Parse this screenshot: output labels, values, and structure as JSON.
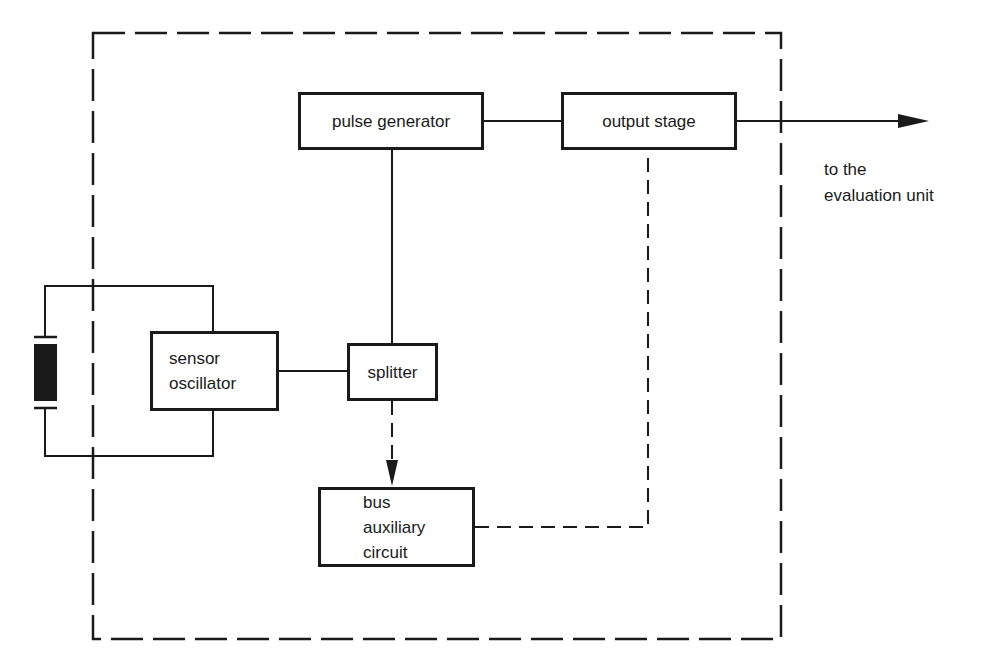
{
  "diagram": {
    "type": "block-diagram",
    "boundary": {
      "style": "dashed",
      "x": 93,
      "y": 33,
      "width": 688,
      "height": 606
    },
    "blocks": {
      "pulse_generator": {
        "label": "pulse generator"
      },
      "output_stage": {
        "label": "output stage"
      },
      "sensor_oscillator": {
        "lines": [
          "sensor",
          "oscillator"
        ]
      },
      "splitter": {
        "label": "splitter"
      },
      "bus_auxiliary_circuit": {
        "lines": [
          "bus",
          "auxiliary",
          "circuit"
        ]
      }
    },
    "crystal": {
      "symbol": "quartz-crystal-icon"
    },
    "output_label": {
      "lines": [
        "to the",
        "evaluation unit"
      ]
    },
    "connections": [
      {
        "from": "sensor crystal",
        "to": "sensor oscillator",
        "style": "solid"
      },
      {
        "from": "sensor oscillator",
        "to": "splitter",
        "style": "solid"
      },
      {
        "from": "splitter",
        "to": "pulse generator",
        "style": "solid"
      },
      {
        "from": "pulse generator",
        "to": "output stage",
        "style": "solid"
      },
      {
        "from": "output stage",
        "to": "evaluation unit",
        "style": "solid-arrow"
      },
      {
        "from": "splitter",
        "to": "bus auxiliary circuit",
        "style": "dashed-arrow"
      },
      {
        "from": "bus auxiliary circuit",
        "to": "output stage",
        "style": "dashed"
      }
    ],
    "colors": {
      "ink": "#1a1a1a",
      "background": "#ffffff"
    }
  }
}
